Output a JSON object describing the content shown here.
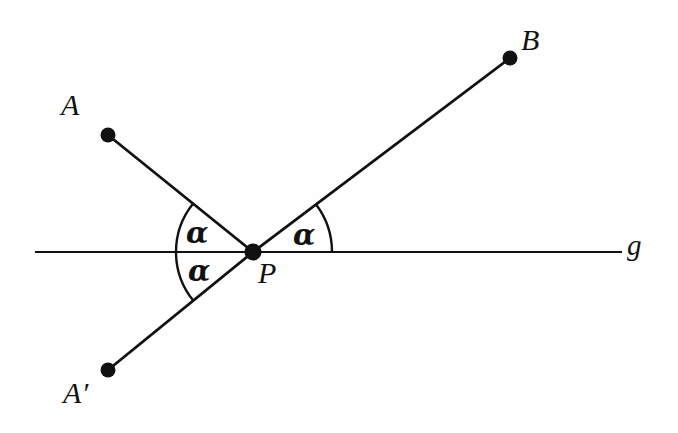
{
  "figure": {
    "kind": "geometry-diagram",
    "background_color": "#fefefe",
    "stroke_color": "#111111",
    "canvas": {
      "width": 678,
      "height": 433
    }
  },
  "labels": {
    "point_a": "A",
    "point_a_prime": "A′",
    "point_b": "B",
    "point_p": "P",
    "line_g": "g",
    "angle_upper_left": "α",
    "angle_lower_left": "α",
    "angle_right": "α"
  },
  "chart_data": {
    "type": "scatter",
    "xlabel": "",
    "ylabel": "",
    "points": [
      {
        "name": "A",
        "x": 108,
        "y": 135,
        "label": "A",
        "label_x": 72,
        "label_y": 108
      },
      {
        "name": "A'",
        "x": 108,
        "y": 370,
        "label": "A′",
        "label_x": 80,
        "label_y": 397
      },
      {
        "name": "B",
        "x": 510,
        "y": 58,
        "label": "B",
        "label_x": 532,
        "label_y": 43
      },
      {
        "name": "P",
        "x": 253,
        "y": 252,
        "label": "P",
        "label_x": 267,
        "label_y": 274
      }
    ],
    "segments": [
      {
        "from": "A",
        "to": "P"
      },
      {
        "from": "P",
        "to": "A'"
      },
      {
        "from": "P",
        "to": "B"
      }
    ],
    "lines": [
      {
        "name": "g",
        "x1": 35,
        "y1": 252,
        "x2": 622,
        "y2": 252,
        "label": "g",
        "label_x": 633,
        "label_y": 246
      }
    ],
    "angles": [
      {
        "name": "angle-APg-upper",
        "label": "α",
        "vertex": "P",
        "radius": 77,
        "start_deg": 180,
        "end_deg": 141,
        "label_x": 198,
        "label_y": 236
      },
      {
        "name": "angle-A'Pg-lower",
        "label": "α",
        "vertex": "P",
        "radius": 77,
        "start_deg": 180,
        "end_deg": 219,
        "label_x": 200,
        "label_y": 273
      },
      {
        "name": "angle-BPg-right",
        "label": "α",
        "vertex": "P",
        "radius": 79,
        "start_deg": 0,
        "end_deg": 37,
        "label_x": 305,
        "label_y": 237
      }
    ]
  }
}
